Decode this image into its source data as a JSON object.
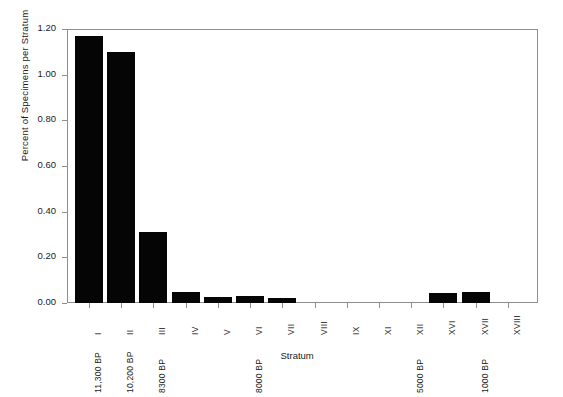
{
  "chart_data": {
    "type": "bar",
    "title": "",
    "xlabel": "Stratum",
    "ylabel": "Percent of Specimens per Stratum",
    "categories": [
      "I",
      "II",
      "III",
      "IV",
      "V",
      "VI",
      "VII",
      "VIII",
      "IX",
      "XI",
      "XII",
      "XVI",
      "XVII",
      "XVIII"
    ],
    "values": [
      1.17,
      1.1,
      0.31,
      0.05,
      0.025,
      0.03,
      0.02,
      0.0,
      0.0,
      0.0,
      0.0,
      0.045,
      0.05,
      0.0
    ],
    "ylim": [
      0.0,
      1.2
    ],
    "yticks": [
      0.0,
      0.2,
      0.4,
      0.6,
      0.8,
      1.0,
      1.2
    ],
    "ytick_labels": [
      "0.00",
      "0.20",
      "0.40",
      "0.60",
      "0.80",
      "1.00",
      "1.20"
    ],
    "grid": false,
    "legend": null,
    "bar_color": "#050505",
    "axis_color": "#8e8e8e",
    "secondary_xticks": [
      {
        "category": "I",
        "label": "11,300 BP"
      },
      {
        "category": "II",
        "label": "10,200 BP"
      },
      {
        "category": "III",
        "label": "8300 BP"
      },
      {
        "category": "VI",
        "label": "8000 BP"
      },
      {
        "category": "XII",
        "label": "5000 BP"
      },
      {
        "category": "XVII",
        "label": "1000 BP"
      }
    ]
  },
  "axes": {
    "y_label": "Percent of Specimens per Stratum",
    "x_label": "Stratum",
    "y_ticks": [
      "1.20",
      "1.00",
      "0.80",
      "0.60",
      "0.40",
      "0.20",
      "0.00"
    ],
    "x_ticks": [
      "I",
      "II",
      "III",
      "IV",
      "V",
      "VI",
      "VII",
      "VIII",
      "IX",
      "XI",
      "XII",
      "XVI",
      "XVII",
      "XVIII"
    ],
    "bp_labels": [
      "11,300 BP",
      "10,200 BP",
      "8300 BP",
      "8000 BP",
      "5000 BP",
      "1000 BP"
    ]
  }
}
